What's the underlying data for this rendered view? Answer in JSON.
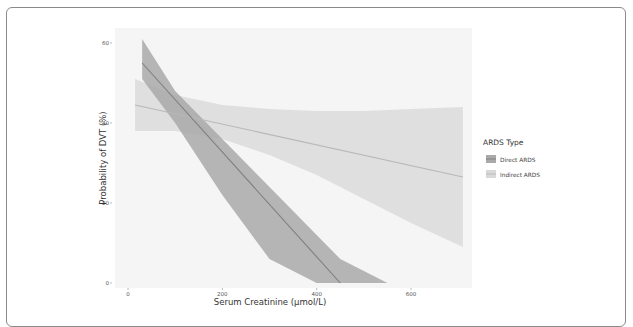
{
  "chart_data": {
    "type": "line",
    "title": "",
    "xlabel": "Serum Creatinine (μmol/L)",
    "ylabel": "Probability of DVT (%)",
    "x_ticks": [
      0,
      200,
      400,
      600
    ],
    "y_ticks": [
      0,
      20,
      40,
      60
    ],
    "xlim": [
      -30,
      740
    ],
    "ylim": [
      -1,
      64
    ],
    "grid": false,
    "legend": {
      "title": "ARDS Type",
      "position": "right",
      "entries": [
        "Direct ARDS",
        "Indirect ARDS"
      ]
    },
    "series": [
      {
        "name": "Direct ARDS",
        "color": "#7f7f7f",
        "band_color": "#a9a9a9",
        "x": [
          30,
          450
        ],
        "y": [
          55,
          0
        ],
        "ci_x": [
          30,
          100,
          200,
          300,
          400,
          450,
          550
        ],
        "ci_upper": [
          61,
          48,
          36,
          24,
          12,
          6,
          0
        ],
        "ci_lower": [
          51,
          40,
          22,
          6,
          0,
          0,
          0
        ]
      },
      {
        "name": "Indirect ARDS",
        "color": "#b8b8b8",
        "band_color": "#d9d9d9",
        "x": [
          15,
          710
        ],
        "y": [
          44.5,
          26.5
        ],
        "ci_x": [
          15,
          100,
          200,
          300,
          400,
          500,
          600,
          710
        ],
        "ci_upper": [
          51,
          47,
          44.5,
          43.5,
          43,
          43,
          43.5,
          44
        ],
        "ci_lower": [
          38,
          38,
          36,
          32,
          27,
          21,
          15,
          9
        ]
      }
    ]
  }
}
